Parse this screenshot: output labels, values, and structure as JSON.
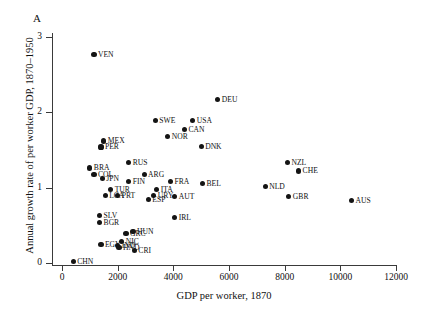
{
  "panel": {
    "letter": "A"
  },
  "chart_data": {
    "type": "scatter",
    "title": "",
    "xlabel": "GDP per worker, 1870",
    "ylabel": "Annual growth rate of per worker GDP, 1870–1950",
    "xlim": [
      0,
      12000
    ],
    "ylim": [
      0,
      3
    ],
    "xticks": [
      0,
      2000,
      4000,
      6000,
      8000,
      10000,
      12000
    ],
    "xtick_labels": [
      "0",
      "2000",
      "4000",
      "6000",
      "8000",
      "10000",
      "12000"
    ],
    "yticks": [
      0,
      1,
      2,
      3
    ],
    "ytick_labels": [
      "0",
      "1",
      "2",
      "3"
    ],
    "grid": false,
    "legend": "none",
    "marker_color": "#141414",
    "points": [
      {
        "label": "VEN",
        "x": 1150,
        "y": 2.77,
        "pos": "r"
      },
      {
        "label": "DEU",
        "x": 5600,
        "y": 2.17,
        "pos": "r"
      },
      {
        "label": "SWE",
        "x": 3350,
        "y": 1.89,
        "pos": "r"
      },
      {
        "label": "USA",
        "x": 4700,
        "y": 1.89,
        "pos": "r"
      },
      {
        "label": "CAN",
        "x": 4400,
        "y": 1.77,
        "pos": "r"
      },
      {
        "label": "NOR",
        "x": 3800,
        "y": 1.68,
        "pos": "r"
      },
      {
        "label": "MEX",
        "x": 1500,
        "y": 1.62,
        "pos": "r"
      },
      {
        "label": "PER",
        "x": 1400,
        "y": 1.54,
        "pos": "r"
      },
      {
        "label": "DNK",
        "x": 5000,
        "y": 1.55,
        "pos": "r"
      },
      {
        "label": "NZL",
        "x": 8100,
        "y": 1.33,
        "pos": "r"
      },
      {
        "label": "CHE",
        "x": 8500,
        "y": 1.22,
        "pos": "r"
      },
      {
        "label": "RUS",
        "x": 2400,
        "y": 1.33,
        "pos": "r"
      },
      {
        "label": "BRA",
        "x": 1000,
        "y": 1.26,
        "pos": "r"
      },
      {
        "label": "COL",
        "x": 1150,
        "y": 1.17,
        "pos": "r"
      },
      {
        "label": "JPN",
        "x": 1450,
        "y": 1.12,
        "pos": "r"
      },
      {
        "label": "ARG",
        "x": 2950,
        "y": 1.17,
        "pos": "r"
      },
      {
        "label": "FIN",
        "x": 2400,
        "y": 1.08,
        "pos": "r"
      },
      {
        "label": "FRA",
        "x": 3900,
        "y": 1.08,
        "pos": "r"
      },
      {
        "label": "BEL",
        "x": 5050,
        "y": 1.05,
        "pos": "r"
      },
      {
        "label": "NLD",
        "x": 7300,
        "y": 1.02,
        "pos": "r"
      },
      {
        "label": "GBR",
        "x": 8150,
        "y": 0.88,
        "pos": "r"
      },
      {
        "label": "AUS",
        "x": 10400,
        "y": 0.83,
        "pos": "r"
      },
      {
        "label": "TUR",
        "x": 1750,
        "y": 0.98,
        "pos": "r"
      },
      {
        "label": "LCA",
        "x": 1550,
        "y": 0.9,
        "pos": "r"
      },
      {
        "label": "PRT",
        "x": 2000,
        "y": 0.9,
        "pos": "r"
      },
      {
        "label": "ITA",
        "x": 3400,
        "y": 0.98,
        "pos": "r"
      },
      {
        "label": "URY",
        "x": 3300,
        "y": 0.9,
        "pos": "r"
      },
      {
        "label": "AUT",
        "x": 4050,
        "y": 0.88,
        "pos": "r"
      },
      {
        "label": "ESP",
        "x": 3100,
        "y": 0.84,
        "pos": "r"
      },
      {
        "label": "SLV",
        "x": 1350,
        "y": 0.63,
        "pos": "r"
      },
      {
        "label": "BGR",
        "x": 1350,
        "y": 0.54,
        "pos": "r"
      },
      {
        "label": "IRL",
        "x": 4050,
        "y": 0.6,
        "pos": "r"
      },
      {
        "label": "GRC",
        "x": 2300,
        "y": 0.39,
        "pos": "r"
      },
      {
        "label": "HUN",
        "x": 2550,
        "y": 0.42,
        "pos": "r"
      },
      {
        "label": "EGY",
        "x": 1400,
        "y": 0.25,
        "pos": "r"
      },
      {
        "label": "NIC",
        "x": 2150,
        "y": 0.29,
        "pos": "r"
      },
      {
        "label": "IND",
        "x": 2000,
        "y": 0.23,
        "pos": "r"
      },
      {
        "label": "HND",
        "x": 2050,
        "y": 0.21,
        "pos": "r"
      },
      {
        "label": "CRI",
        "x": 2600,
        "y": 0.17,
        "pos": "r"
      },
      {
        "label": "CHN",
        "x": 400,
        "y": 0.02,
        "pos": "r"
      }
    ]
  }
}
